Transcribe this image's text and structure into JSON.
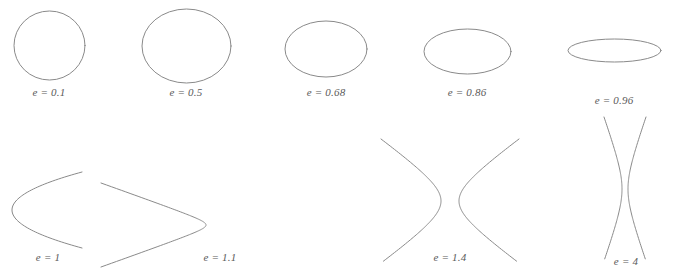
{
  "figure": {
    "background_color": "#ffffff",
    "stroke_color": "#8a8a8a",
    "label_color": "#5a5a5a",
    "stroke_width": 1
  },
  "chart_data": {
    "type": "line",
    "xlabel": "",
    "ylabel": "",
    "grid": false,
    "legend": "none",
    "xlim": [
      0,
      674
    ],
    "ylim": [
      279,
      0
    ],
    "series": [
      {
        "name": "e = 0.1",
        "shape": "ellipse",
        "eccentricity": 0.1,
        "label": "e = 0.1",
        "cx": 49.5,
        "cy": 45.5,
        "rx": 35.5,
        "ry": 34.5,
        "label_x": 49,
        "label_y": 92
      },
      {
        "name": "e = 0.5",
        "shape": "ellipse",
        "eccentricity": 0.5,
        "label": "e = 0.5",
        "cx": 186.5,
        "cy": 46,
        "rx": 44.5,
        "ry": 37,
        "label_x": 186,
        "label_y": 92
      },
      {
        "name": "e = 0.68",
        "shape": "ellipse",
        "eccentricity": 0.68,
        "label": "e = 0.68",
        "cx": 326,
        "cy": 49,
        "rx": 41,
        "ry": 28,
        "label_x": 326,
        "label_y": 92
      },
      {
        "name": "e = 0.86",
        "shape": "ellipse",
        "eccentricity": 0.86,
        "label": "e = 0.86",
        "cx": 467.5,
        "cy": 51.5,
        "rx": 43.5,
        "ry": 22.5,
        "label_x": 467,
        "label_y": 92
      },
      {
        "name": "e = 0.96",
        "shape": "ellipse",
        "eccentricity": 0.96,
        "label": "e = 0.96",
        "cx": 614.5,
        "cy": 50.5,
        "rx": 46.5,
        "ry": 11.5,
        "label_x": 614,
        "label_y": 100
      },
      {
        "name": "e = 1",
        "shape": "parabola",
        "eccentricity": 1,
        "label": "e = 1",
        "opens": "right",
        "vertex_x": 12,
        "vertex_y": 210,
        "half_height": 38,
        "extent": 70,
        "label_x": 48,
        "label_y": 260
      },
      {
        "name": "e = 1.1",
        "shape": "hyperbola-branch",
        "eccentricity": 1.1,
        "label": "e = 1.1",
        "opens": "left",
        "vertex_x": 206,
        "vertex_y": 225,
        "half_height": 42,
        "extent": 105,
        "label_x": 220,
        "label_y": 260
      },
      {
        "name": "e = 1.4",
        "shape": "hyperbola-pair",
        "eccentricity": 1.4,
        "label": "e = 1.4",
        "left_vertex_x": 441,
        "right_vertex_x": 459,
        "center_y": 201,
        "half_height": 62,
        "extent": 60,
        "label_x": 450,
        "label_y": 260
      },
      {
        "name": "e = 4",
        "shape": "hyperbola-pair",
        "eccentricity": 4,
        "label": "e = 4",
        "left_vertex_x": 622,
        "right_vertex_x": 628,
        "center_y": 189,
        "half_height": 72,
        "extent": 18,
        "label_x": 626,
        "label_y": 264
      }
    ]
  },
  "labels": {
    "e01": "e = 0.1",
    "e05": "e = 0.5",
    "e068": "e = 0.68",
    "e086": "e = 0.86",
    "e096": "e = 0.96",
    "e1": "e = 1",
    "e11": "e = 1.1",
    "e14": "e = 1.4",
    "e4": "e = 4"
  }
}
